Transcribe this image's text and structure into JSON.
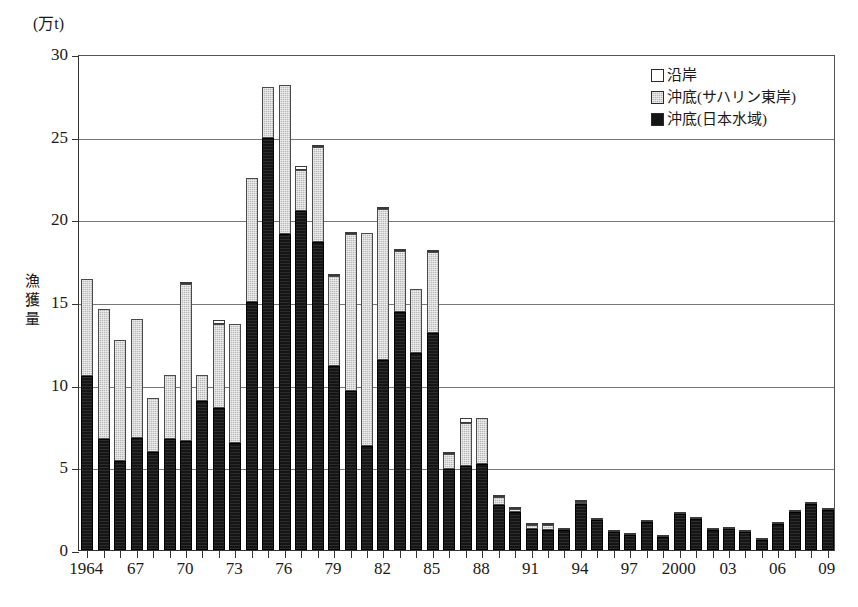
{
  "chart_data": {
    "type": "bar",
    "subtype": "stacked",
    "title": "",
    "unit_caption": "(万t)",
    "ylabel": "漁獲量",
    "xlabel": "",
    "ylim": [
      0,
      30
    ],
    "yticks": [
      0,
      5,
      10,
      15,
      20,
      25,
      30
    ],
    "grid": true,
    "legend_position": "top-right",
    "x": [
      1964,
      1965,
      1966,
      1967,
      1968,
      1969,
      1970,
      1971,
      1972,
      1973,
      1974,
      1975,
      1976,
      1977,
      1978,
      1979,
      1980,
      1981,
      1982,
      1983,
      1984,
      1985,
      1986,
      1987,
      1988,
      1989,
      1990,
      1991,
      1992,
      1993,
      1994,
      1995,
      1996,
      1997,
      1998,
      1999,
      2000,
      2001,
      2002,
      2003,
      2004,
      2005,
      2006,
      2007,
      2008,
      2009
    ],
    "xtick_labels": [
      "1964",
      "",
      "",
      "67",
      "",
      "",
      "70",
      "",
      "",
      "73",
      "",
      "",
      "76",
      "",
      "",
      "79",
      "",
      "",
      "82",
      "",
      "",
      "85",
      "",
      "",
      "88",
      "",
      "",
      "91",
      "",
      "",
      "94",
      "",
      "",
      "97",
      "",
      "",
      "2000",
      "",
      "",
      "03",
      "",
      "",
      "06",
      "",
      "",
      "09"
    ],
    "series": [
      {
        "name": "沖底(日本水域)",
        "key": "japan",
        "color": "#151515",
        "values": [
          10.5,
          6.7,
          5.4,
          6.8,
          5.9,
          6.7,
          6.6,
          9.0,
          8.6,
          6.5,
          15.0,
          24.9,
          19.1,
          20.5,
          18.6,
          11.1,
          9.6,
          6.3,
          11.5,
          14.4,
          11.9,
          13.1,
          4.9,
          5.1,
          5.2,
          2.7,
          2.3,
          1.3,
          1.2,
          1.2,
          2.8,
          1.8,
          1.1,
          0.9,
          1.7,
          0.8,
          2.2,
          1.9,
          1.2,
          1.3,
          1.1,
          0.6,
          1.6,
          2.3,
          2.8,
          2.4
        ]
      },
      {
        "name": "沖底(サハリン東岸)",
        "key": "sakhalin",
        "color": "#b9b9b9",
        "values": [
          5.9,
          7.9,
          7.3,
          7.2,
          3.3,
          3.9,
          9.5,
          1.6,
          5.1,
          7.2,
          7.5,
          3.1,
          9.0,
          2.5,
          5.8,
          5.5,
          9.5,
          12.9,
          9.1,
          3.7,
          3.9,
          4.9,
          0.9,
          2.6,
          2.8,
          0.5,
          0.2,
          0.2,
          0.3,
          0.0,
          0.1,
          0.0,
          0.0,
          0.0,
          0.0,
          0.0,
          0.0,
          0.0,
          0.0,
          0.0,
          0.0,
          0.0,
          0.0,
          0.0,
          0.0,
          0.0
        ]
      },
      {
        "name": "沿岸",
        "key": "coast",
        "color": "#ffffff",
        "values": [
          0.0,
          0.0,
          0.0,
          0.0,
          0.0,
          0.0,
          0.1,
          0.0,
          0.2,
          0.0,
          0.0,
          0.0,
          0.0,
          0.2,
          0.1,
          0.1,
          0.1,
          0.0,
          0.1,
          0.1,
          0.0,
          0.1,
          0.1,
          0.3,
          0.0,
          0.1,
          0.1,
          0.1,
          0.1,
          0.1,
          0.1,
          0.1,
          0.1,
          0.1,
          0.1,
          0.1,
          0.1,
          0.1,
          0.1,
          0.1,
          0.1,
          0.1,
          0.1,
          0.1,
          0.1,
          0.1
        ]
      }
    ],
    "totals": [
      16.4,
      14.6,
      12.7,
      14.0,
      9.2,
      10.6,
      16.2,
      10.6,
      13.9,
      13.7,
      22.5,
      28.0,
      28.1,
      23.2,
      24.5,
      16.7,
      19.2,
      19.2,
      20.7,
      18.2,
      15.8,
      18.1,
      5.9,
      8.0,
      8.0,
      3.3,
      2.6,
      1.6,
      1.6,
      1.3,
      3.0,
      1.9,
      1.2,
      1.0,
      1.8,
      0.9,
      2.3,
      2.0,
      1.3,
      1.4,
      1.2,
      0.7,
      1.7,
      2.4,
      2.9,
      2.5
    ]
  },
  "legend": {
    "items": [
      {
        "label": "沿岸",
        "key": "coast"
      },
      {
        "label": "沖底(サハリン東岸)",
        "key": "sakhalin"
      },
      {
        "label": "沖底(日本水域)",
        "key": "japan"
      }
    ]
  }
}
